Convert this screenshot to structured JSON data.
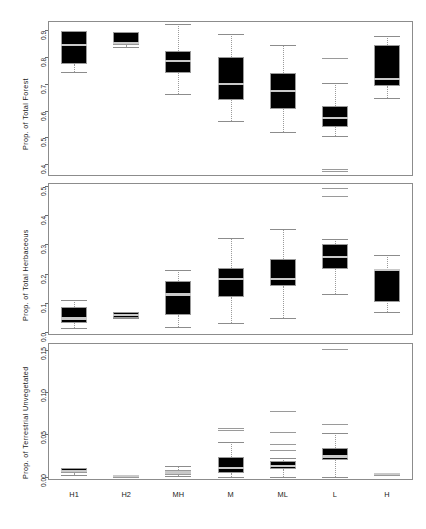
{
  "chart_data": [
    {
      "type": "boxplot",
      "panel_index": 0,
      "title": "",
      "xlabel": "",
      "ylabel": "Prop. of Total Forest",
      "categories": [
        "H1",
        "H2",
        "MH",
        "M",
        "ML",
        "L",
        "H"
      ],
      "ylim": [
        0.355,
        0.935
      ],
      "yticks": [
        0.4,
        0.5,
        0.6,
        0.7,
        0.8,
        0.9
      ],
      "ytick_labels": [
        "0.4",
        "0.5",
        "0.6",
        "0.7",
        "0.8",
        "0.9"
      ],
      "grid": false,
      "boxes": [
        {
          "category": "H1",
          "lower_whisker": 0.745,
          "q1": 0.775,
          "median": 0.845,
          "q3": 0.898,
          "upper_whisker": 0.898,
          "outliers": []
        },
        {
          "category": "H2",
          "lower_whisker": 0.838,
          "q1": 0.845,
          "median": 0.853,
          "q3": 0.893,
          "upper_whisker": 0.893,
          "outliers": []
        },
        {
          "category": "MH",
          "lower_whisker": 0.663,
          "q1": 0.742,
          "median": 0.785,
          "q3": 0.822,
          "upper_whisker": 0.922,
          "outliers": []
        },
        {
          "category": "M",
          "lower_whisker": 0.562,
          "q1": 0.639,
          "median": 0.7,
          "q3": 0.8,
          "upper_whisker": 0.888,
          "outliers": []
        },
        {
          "category": "ML",
          "lower_whisker": 0.518,
          "q1": 0.607,
          "median": 0.673,
          "q3": 0.742,
          "upper_whisker": 0.845,
          "outliers": []
        },
        {
          "category": "L",
          "lower_whisker": 0.504,
          "q1": 0.537,
          "median": 0.573,
          "q3": 0.616,
          "upper_whisker": 0.704,
          "outliers": [
            0.796,
            0.381,
            0.374
          ]
        },
        {
          "category": "H",
          "lower_whisker": 0.648,
          "q1": 0.692,
          "median": 0.718,
          "q3": 0.845,
          "upper_whisker": 0.88,
          "outliers": []
        }
      ]
    },
    {
      "type": "boxplot",
      "panel_index": 1,
      "title": "",
      "xlabel": "",
      "ylabel": "Prop. of Total Herbaceous",
      "categories": [
        "H1",
        "H2",
        "MH",
        "M",
        "ML",
        "L",
        "H"
      ],
      "ylim": [
        -0.012,
        0.512
      ],
      "yticks": [
        0.0,
        0.1,
        0.2,
        0.3,
        0.4,
        0.5
      ],
      "ytick_labels": [
        "0.0",
        "0.1",
        "0.2",
        "0.3",
        "0.4",
        "0.5"
      ],
      "grid": false,
      "boxes": [
        {
          "category": "H1",
          "lower_whisker": 0.012,
          "q1": 0.028,
          "median": 0.045,
          "q3": 0.083,
          "upper_whisker": 0.108,
          "outliers": []
        },
        {
          "category": "H2",
          "lower_whisker": 0.046,
          "q1": 0.048,
          "median": 0.058,
          "q3": 0.068,
          "upper_whisker": 0.068,
          "outliers": []
        },
        {
          "category": "MH",
          "lower_whisker": 0.015,
          "q1": 0.056,
          "median": 0.128,
          "q3": 0.175,
          "upper_whisker": 0.213,
          "outliers": []
        },
        {
          "category": "M",
          "lower_whisker": 0.031,
          "q1": 0.12,
          "median": 0.182,
          "q3": 0.219,
          "upper_whisker": 0.322,
          "outliers": []
        },
        {
          "category": "ML",
          "lower_whisker": 0.046,
          "q1": 0.157,
          "median": 0.18,
          "q3": 0.251,
          "upper_whisker": 0.353,
          "outliers": []
        },
        {
          "category": "L",
          "lower_whisker": 0.131,
          "q1": 0.215,
          "median": 0.257,
          "q3": 0.303,
          "upper_whisker": 0.318,
          "outliers": [
            0.494,
            0.468
          ]
        },
        {
          "category": "H",
          "lower_whisker": 0.066,
          "q1": 0.1,
          "median": 0.212,
          "q3": 0.213,
          "upper_whisker": 0.264,
          "outliers": []
        }
      ]
    },
    {
      "type": "boxplot",
      "panel_index": 2,
      "title": "",
      "xlabel": "",
      "ylabel": "Prop. of Terrestrial Unvegetated",
      "categories": [
        "H1",
        "H2",
        "MH",
        "M",
        "ML",
        "L",
        "H"
      ],
      "ylim": [
        -0.004,
        0.158
      ],
      "yticks": [
        0.0,
        0.05,
        0.1,
        0.15
      ],
      "ytick_labels": [
        "0.00",
        "0.05",
        "0.10",
        "0.15"
      ],
      "grid": false,
      "boxes": [
        {
          "category": "H1",
          "lower_whisker": 0.002,
          "q1": 0.004,
          "median": 0.007,
          "q3": 0.01,
          "upper_whisker": 0.01,
          "outliers": []
        },
        {
          "category": "H2",
          "lower_whisker": 0.0,
          "q1": 0.0,
          "median": 0.001,
          "q3": 0.001,
          "upper_whisker": 0.001,
          "outliers": []
        },
        {
          "category": "MH",
          "lower_whisker": 0.001,
          "q1": 0.002,
          "median": 0.005,
          "q3": 0.008,
          "upper_whisker": 0.013,
          "outliers": []
        },
        {
          "category": "M",
          "lower_whisker": 0.0,
          "q1": 0.004,
          "median": 0.01,
          "q3": 0.023,
          "upper_whisker": 0.041,
          "outliers": [
            0.057,
            0.055
          ]
        },
        {
          "category": "ML",
          "lower_whisker": 0.0,
          "q1": 0.009,
          "median": 0.013,
          "q3": 0.018,
          "upper_whisker": 0.022,
          "outliers": [
            0.078,
            0.053,
            0.039,
            0.031
          ]
        },
        {
          "category": "L",
          "lower_whisker": 0.0,
          "q1": 0.02,
          "median": 0.024,
          "q3": 0.034,
          "upper_whisker": 0.052,
          "outliers": [
            0.151,
            0.062
          ]
        },
        {
          "category": "H",
          "lower_whisker": 0.002,
          "q1": 0.002,
          "median": 0.003,
          "q3": 0.004,
          "upper_whisker": 0.004,
          "outliers": []
        }
      ]
    }
  ],
  "figure": {
    "background": "#ffffff",
    "box_fill": "#000000",
    "box_edge": "#9a9a9a",
    "median_color": "#c9c9c9",
    "whisker_color": "#9a9a9a",
    "frame_color": "#8c8c8c"
  }
}
